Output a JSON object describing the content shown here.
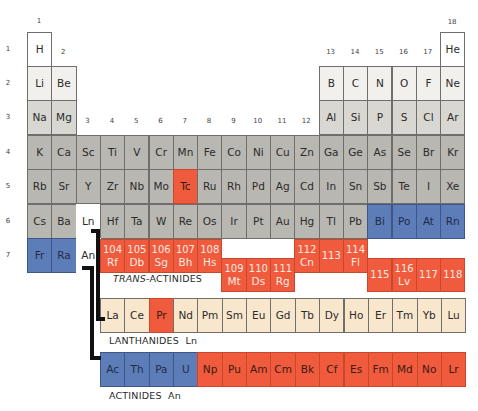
{
  "colors": {
    "white": "#ffffff",
    "light": "#f1f0ed",
    "mid": "#d8d7d2",
    "grey": "#b9b7b2",
    "red": "#ef5b3c",
    "blue": "#5d7db9",
    "cream": "#f9e7cd"
  },
  "group_labels": [
    "1",
    "2",
    "3",
    "4",
    "5",
    "6",
    "7",
    "8",
    "9",
    "10",
    "11",
    "12",
    "13",
    "14",
    "15",
    "16",
    "17",
    "18"
  ],
  "period_labels": [
    "1",
    "2",
    "3",
    "4",
    "5",
    "6",
    "7"
  ],
  "main_table": [
    {
      "period": 1,
      "cells": [
        {
          "g": 1,
          "sym": "H",
          "color": "white"
        },
        {
          "g": 18,
          "sym": "He",
          "color": "white"
        }
      ]
    },
    {
      "period": 2,
      "cells": [
        {
          "g": 1,
          "sym": "Li",
          "color": "light"
        },
        {
          "g": 2,
          "sym": "Be",
          "color": "light"
        },
        {
          "g": 13,
          "sym": "B",
          "color": "light"
        },
        {
          "g": 14,
          "sym": "C",
          "color": "light"
        },
        {
          "g": 15,
          "sym": "N",
          "color": "light"
        },
        {
          "g": 16,
          "sym": "O",
          "color": "light"
        },
        {
          "g": 17,
          "sym": "F",
          "color": "light"
        },
        {
          "g": 18,
          "sym": "Ne",
          "color": "light"
        }
      ]
    },
    {
      "period": 3,
      "cells": [
        {
          "g": 1,
          "sym": "Na",
          "color": "mid"
        },
        {
          "g": 2,
          "sym": "Mg",
          "color": "mid"
        },
        {
          "g": 13,
          "sym": "Al",
          "color": "mid"
        },
        {
          "g": 14,
          "sym": "Si",
          "color": "mid"
        },
        {
          "g": 15,
          "sym": "P",
          "color": "mid"
        },
        {
          "g": 16,
          "sym": "S",
          "color": "mid"
        },
        {
          "g": 17,
          "sym": "Cl",
          "color": "mid"
        },
        {
          "g": 18,
          "sym": "Ar",
          "color": "mid"
        }
      ]
    },
    {
      "period": 4,
      "cells": [
        {
          "g": 1,
          "sym": "K",
          "color": "grey"
        },
        {
          "g": 2,
          "sym": "Ca",
          "color": "grey"
        },
        {
          "g": 3,
          "sym": "Sc",
          "color": "grey"
        },
        {
          "g": 4,
          "sym": "Ti",
          "color": "grey"
        },
        {
          "g": 5,
          "sym": "V",
          "color": "grey"
        },
        {
          "g": 6,
          "sym": "Cr",
          "color": "grey"
        },
        {
          "g": 7,
          "sym": "Mn",
          "color": "grey"
        },
        {
          "g": 8,
          "sym": "Fe",
          "color": "grey"
        },
        {
          "g": 9,
          "sym": "Co",
          "color": "grey"
        },
        {
          "g": 10,
          "sym": "Ni",
          "color": "grey"
        },
        {
          "g": 11,
          "sym": "Cu",
          "color": "grey"
        },
        {
          "g": 12,
          "sym": "Zn",
          "color": "grey"
        },
        {
          "g": 13,
          "sym": "Ga",
          "color": "grey"
        },
        {
          "g": 14,
          "sym": "Ge",
          "color": "grey"
        },
        {
          "g": 15,
          "sym": "As",
          "color": "grey"
        },
        {
          "g": 16,
          "sym": "Se",
          "color": "grey"
        },
        {
          "g": 17,
          "sym": "Br",
          "color": "grey"
        },
        {
          "g": 18,
          "sym": "Kr",
          "color": "grey"
        }
      ]
    },
    {
      "period": 5,
      "cells": [
        {
          "g": 1,
          "sym": "Rb",
          "color": "grey"
        },
        {
          "g": 2,
          "sym": "Sr",
          "color": "grey"
        },
        {
          "g": 3,
          "sym": "Y",
          "color": "grey"
        },
        {
          "g": 4,
          "sym": "Zr",
          "color": "grey"
        },
        {
          "g": 5,
          "sym": "Nb",
          "color": "grey"
        },
        {
          "g": 6,
          "sym": "Mo",
          "color": "grey"
        },
        {
          "g": 7,
          "sym": "Tc",
          "color": "red"
        },
        {
          "g": 8,
          "sym": "Ru",
          "color": "grey"
        },
        {
          "g": 9,
          "sym": "Rh",
          "color": "grey"
        },
        {
          "g": 10,
          "sym": "Pd",
          "color": "grey"
        },
        {
          "g": 11,
          "sym": "Ag",
          "color": "grey"
        },
        {
          "g": 12,
          "sym": "Cd",
          "color": "grey"
        },
        {
          "g": 13,
          "sym": "In",
          "color": "grey"
        },
        {
          "g": 14,
          "sym": "Sn",
          "color": "grey"
        },
        {
          "g": 15,
          "sym": "Sb",
          "color": "grey"
        },
        {
          "g": 16,
          "sym": "Te",
          "color": "grey"
        },
        {
          "g": 17,
          "sym": "I",
          "color": "grey"
        },
        {
          "g": 18,
          "sym": "Xe",
          "color": "grey"
        }
      ]
    },
    {
      "period": 6,
      "cells": [
        {
          "g": 1,
          "sym": "Cs",
          "color": "grey"
        },
        {
          "g": 2,
          "sym": "Ba",
          "color": "grey"
        },
        {
          "g": 3,
          "sym": "Ln",
          "color": "ghost"
        },
        {
          "g": 4,
          "sym": "Hf",
          "color": "grey"
        },
        {
          "g": 5,
          "sym": "Ta",
          "color": "grey"
        },
        {
          "g": 6,
          "sym": "W",
          "color": "grey"
        },
        {
          "g": 7,
          "sym": "Re",
          "color": "grey"
        },
        {
          "g": 8,
          "sym": "Os",
          "color": "grey"
        },
        {
          "g": 9,
          "sym": "Ir",
          "color": "grey"
        },
        {
          "g": 10,
          "sym": "Pt",
          "color": "grey"
        },
        {
          "g": 11,
          "sym": "Au",
          "color": "grey"
        },
        {
          "g": 12,
          "sym": "Hg",
          "color": "grey"
        },
        {
          "g": 13,
          "sym": "Tl",
          "color": "grey"
        },
        {
          "g": 14,
          "sym": "Pb",
          "color": "grey"
        },
        {
          "g": 15,
          "sym": "Bi",
          "color": "blue"
        },
        {
          "g": 16,
          "sym": "Po",
          "color": "blue"
        },
        {
          "g": 17,
          "sym": "At",
          "color": "blue"
        },
        {
          "g": 18,
          "sym": "Rn",
          "color": "blue"
        }
      ]
    },
    {
      "period": 7,
      "cells": [
        {
          "g": 1,
          "sym": "Fr",
          "color": "blue"
        },
        {
          "g": 2,
          "sym": "Ra",
          "color": "blue"
        },
        {
          "g": 3,
          "sym": "An",
          "color": "ghost"
        }
      ]
    }
  ],
  "transactinides": {
    "label_prefix": "TRANS",
    "label_suffix": "-ACTINIDES",
    "upper": [
      {
        "g": 4,
        "num": "104",
        "sym": "Rf"
      },
      {
        "g": 5,
        "num": "105",
        "sym": "Db"
      },
      {
        "g": 6,
        "num": "106",
        "sym": "Sg"
      },
      {
        "g": 7,
        "num": "107",
        "sym": "Bh"
      },
      {
        "g": 8,
        "num": "108",
        "sym": "Hs"
      },
      {
        "g": 12,
        "num": "112",
        "sym": "Cn"
      },
      {
        "g": 13,
        "num": "113",
        "sym": ""
      },
      {
        "g": 14,
        "num": "114",
        "sym": "Fl"
      }
    ],
    "lower": [
      {
        "g": 9,
        "num": "109",
        "sym": "Mt"
      },
      {
        "g": 10,
        "num": "110",
        "sym": "Ds"
      },
      {
        "g": 11,
        "num": "111",
        "sym": "Rg"
      },
      {
        "g": 15,
        "num": "115",
        "sym": ""
      },
      {
        "g": 16,
        "num": "116",
        "sym": "Lv"
      },
      {
        "g": 17,
        "num": "117",
        "sym": ""
      },
      {
        "g": 18,
        "num": "118",
        "sym": ""
      }
    ]
  },
  "lanthanides": {
    "label": "LANTHANIDES  Ln",
    "cells": [
      {
        "sym": "La",
        "color": "cream"
      },
      {
        "sym": "Ce",
        "color": "cream"
      },
      {
        "sym": "Pr",
        "color": "red"
      },
      {
        "sym": "Nd",
        "color": "cream"
      },
      {
        "sym": "Pm",
        "color": "cream"
      },
      {
        "sym": "Sm",
        "color": "cream"
      },
      {
        "sym": "Eu",
        "color": "cream"
      },
      {
        "sym": "Gd",
        "color": "cream"
      },
      {
        "sym": "Tb",
        "color": "cream"
      },
      {
        "sym": "Dy",
        "color": "cream"
      },
      {
        "sym": "Ho",
        "color": "cream"
      },
      {
        "sym": "Er",
        "color": "cream"
      },
      {
        "sym": "Tm",
        "color": "cream"
      },
      {
        "sym": "Yb",
        "color": "cream"
      },
      {
        "sym": "Lu",
        "color": "cream"
      }
    ]
  },
  "actinides": {
    "label": "ACTINIDES  An",
    "cells": [
      {
        "sym": "Ac",
        "color": "blue"
      },
      {
        "sym": "Th",
        "color": "blue"
      },
      {
        "sym": "Pa",
        "color": "blue"
      },
      {
        "sym": "U",
        "color": "blue"
      },
      {
        "sym": "Np",
        "color": "red"
      },
      {
        "sym": "Pu",
        "color": "red"
      },
      {
        "sym": "Am",
        "color": "red"
      },
      {
        "sym": "Cm",
        "color": "red"
      },
      {
        "sym": "Bk",
        "color": "red"
      },
      {
        "sym": "Cf",
        "color": "red"
      },
      {
        "sym": "Es",
        "color": "red"
      },
      {
        "sym": "Fm",
        "color": "red"
      },
      {
        "sym": "Md",
        "color": "red"
      },
      {
        "sym": "No",
        "color": "red"
      },
      {
        "sym": "Lr",
        "color": "red"
      }
    ]
  }
}
